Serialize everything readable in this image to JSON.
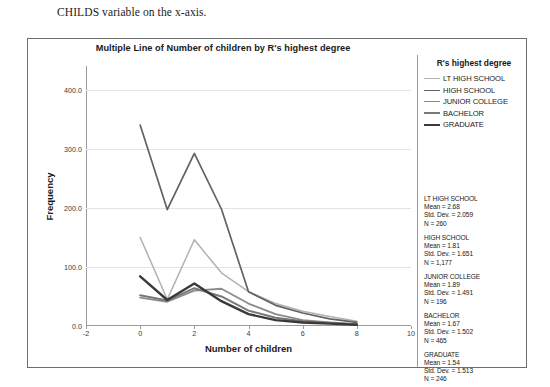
{
  "caption": {
    "text": "CHILDS variable on the x-axis."
  },
  "chart_data": {
    "type": "line",
    "title": "Multiple Line of Number of children by R's highest degree",
    "xlabel": "Number of children",
    "ylabel": "Frequency",
    "x": [
      0,
      1,
      2,
      3,
      4,
      5,
      6,
      7,
      8
    ],
    "xlim": [
      -2,
      10
    ],
    "ylim": [
      0,
      440
    ],
    "xticks": [
      "-2",
      "0",
      "2",
      "4",
      "6",
      "8",
      "10"
    ],
    "xtick_values": [
      -2,
      0,
      2,
      4,
      6,
      8,
      10
    ],
    "yticks": [
      "0.0",
      "100.0",
      "200.0",
      "300.0",
      "400.0"
    ],
    "ytick_values": [
      0,
      100,
      200,
      300,
      400
    ],
    "grid": true,
    "legend_position": "right",
    "legend_title": "R's highest degree",
    "series": [
      {
        "name": "LT HIGH SCHOOL",
        "color": "#b2b2b2",
        "width": 1.5,
        "values": [
          150,
          45,
          146,
          90,
          58,
          38,
          25,
          16,
          8
        ]
      },
      {
        "name": "HIGH SCHOOL",
        "color": "#626262",
        "width": 1.7,
        "values": [
          340,
          197,
          292,
          198,
          58,
          35,
          22,
          12,
          6
        ]
      },
      {
        "name": "JUNIOR COLLEGE",
        "color": "#8c8c8c",
        "width": 1.8,
        "values": [
          48,
          41,
          60,
          63,
          38,
          20,
          10,
          6,
          3
        ]
      },
      {
        "name": "BACHELOR",
        "color": "#787878",
        "width": 2.0,
        "values": [
          52,
          43,
          64,
          50,
          26,
          14,
          8,
          5,
          3
        ]
      },
      {
        "name": "GRADUATE",
        "color": "#3a3a3a",
        "width": 2.4,
        "values": [
          84,
          44,
          72,
          42,
          20,
          10,
          6,
          4,
          2
        ]
      }
    ]
  },
  "statistics": [
    {
      "group": "LT HIGH SCHOOL",
      "mean": "Mean = 2.68",
      "std_dev": "Std. Dev. = 2.059",
      "n": "N = 260"
    },
    {
      "group": "HIGH SCHOOL",
      "mean": "Mean = 1.81",
      "std_dev": "Std. Dev. = 1.651",
      "n": "N = 1,177"
    },
    {
      "group": "JUNIOR COLLEGE",
      "mean": "Mean = 1.89",
      "std_dev": "Std. Dev. = 1.491",
      "n": "N = 196"
    },
    {
      "group": "BACHELOR",
      "mean": "Mean = 1.67",
      "std_dev": "Std. Dev. = 1.502",
      "n": "N = 465"
    },
    {
      "group": "GRADUATE",
      "mean": "Mean = 1.54",
      "std_dev": "Std. Dev. = 1.513",
      "n": "N = 246"
    }
  ]
}
